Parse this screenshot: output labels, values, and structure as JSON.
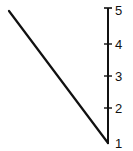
{
  "diagram": {
    "type": "vertical-scale-with-diagonal",
    "scale": {
      "ticks": [
        {
          "label": "5",
          "y": 9
        },
        {
          "label": "4",
          "y": 44
        },
        {
          "label": "3",
          "y": 76
        },
        {
          "label": "2",
          "y": 108
        },
        {
          "label": "1",
          "y": 143
        }
      ]
    },
    "diagonal_line": {
      "from": "top-left",
      "to": "scale value 1"
    },
    "colors": {
      "stroke": "#111111",
      "background": "#ffffff"
    }
  }
}
